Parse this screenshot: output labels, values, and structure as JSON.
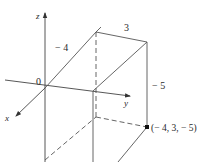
{
  "diagram": {
    "type": "3d-coordinate-box",
    "axes": {
      "x_label": "x",
      "y_label": "y",
      "z_label": "z",
      "origin_label": "0"
    },
    "dimension_labels": {
      "x_extent": "− 4",
      "y_extent": "3",
      "z_extent": "− 5"
    },
    "point": {
      "label": "(− 4, 3, − 5)",
      "coords": [
        -4,
        3,
        -5
      ]
    },
    "colors": {
      "line": "#555555",
      "text": "#2a2a2a",
      "background": "#ffffff"
    }
  }
}
